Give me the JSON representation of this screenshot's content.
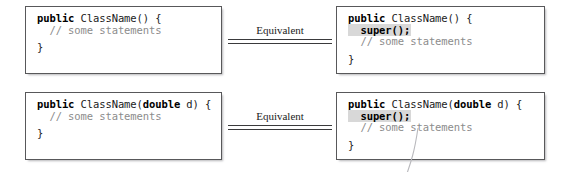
{
  "figure": {
    "rows": [
      {
        "id": "no-arg-constructor",
        "left_box": {
          "name": "constructor-without-explicit-super",
          "lines": [
            {
              "kind": "code",
              "keyword": "public",
              "rest": " ClassName() {"
            },
            {
              "kind": "comment",
              "text": "  // some statements"
            },
            {
              "kind": "blank",
              "text": ""
            },
            {
              "kind": "code",
              "keyword": "",
              "rest": "}"
            }
          ]
        },
        "connector": {
          "label": "Equivalent",
          "name": "equivalent-connector"
        },
        "right_box": {
          "name": "constructor-with-explicit-super",
          "lines": [
            {
              "kind": "code",
              "keyword": "public",
              "rest": " ClassName() {"
            },
            {
              "kind": "highlight",
              "text": "  super();"
            },
            {
              "kind": "comment",
              "text": "  // some statements"
            },
            {
              "kind": "blank",
              "text": ""
            },
            {
              "kind": "code",
              "keyword": "",
              "rest": "}"
            }
          ]
        }
      },
      {
        "id": "double-arg-constructor",
        "left_box": {
          "name": "param-constructor-without-explicit-super",
          "lines": [
            {
              "kind": "code-two-kw",
              "keyword": "public",
              "mid": " ClassName(",
              "keyword2": "double",
              "rest": " d) {"
            },
            {
              "kind": "comment",
              "text": "  // some statements"
            },
            {
              "kind": "blank",
              "text": ""
            },
            {
              "kind": "code",
              "keyword": "",
              "rest": "}"
            }
          ]
        },
        "connector": {
          "label": "Equivalent",
          "name": "equivalent-connector"
        },
        "right_box": {
          "name": "param-constructor-with-explicit-super",
          "lines": [
            {
              "kind": "code-two-kw",
              "keyword": "public",
              "mid": " ClassName(",
              "keyword2": "double",
              "rest": " d) {"
            },
            {
              "kind": "highlight",
              "text": "  super();"
            },
            {
              "kind": "comment",
              "text": "  // some statements"
            },
            {
              "kind": "blank",
              "text": ""
            },
            {
              "kind": "code",
              "keyword": "",
              "rest": "}"
            }
          ]
        }
      }
    ],
    "colors": {
      "box_border": "#58585a",
      "comment_text": "#8c8c8c",
      "highlight_background": "#d8d8d8",
      "code_text": "#1b1b1b",
      "rule": "#3a3a3c",
      "page_background": "#ffffff"
    }
  }
}
